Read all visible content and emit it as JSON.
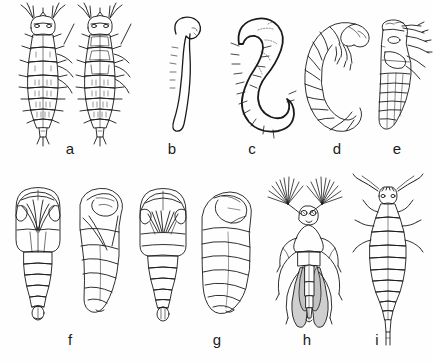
{
  "figure": {
    "type": "scientific-line-illustration",
    "panel_count": 9,
    "background_color": "#fefefe",
    "ink_color": "#1a1a1a",
    "shading_color": "#a8a8a8",
    "rows": 2,
    "row_1_panels": [
      "a",
      "b",
      "c",
      "d",
      "e"
    ],
    "row_2_panels": [
      "f",
      "g",
      "h",
      "i"
    ]
  },
  "labels": [
    {
      "id": "a",
      "text": "a",
      "x": 58,
      "y": 141,
      "caption": "first and second instar larvae, dorsal view"
    },
    {
      "id": "b",
      "text": "b",
      "x": 160,
      "y": 141,
      "caption": "prepupa, lateral outline"
    },
    {
      "id": "c",
      "text": "c",
      "x": 240,
      "y": 141,
      "caption": "curved setose larva, lateral view"
    },
    {
      "id": "d",
      "text": "d",
      "x": 325,
      "y": 141,
      "caption": "segmented larva with appendages, lateral view"
    },
    {
      "id": "e",
      "text": "e",
      "x": 385,
      "y": 141,
      "caption": "pupa with developing legs, lateral view"
    },
    {
      "id": "f",
      "text": "f",
      "x": 58,
      "y": 332,
      "caption": "pupa, ventral and lateral views"
    },
    {
      "id": "g",
      "text": "g",
      "x": 205,
      "y": 332,
      "caption": "pupa, ventral and lateral views"
    },
    {
      "id": "h",
      "text": "h",
      "x": 295,
      "y": 332,
      "caption": "adult with plumose antennae and shaded wings, dorsal view"
    },
    {
      "id": "i",
      "text": "i",
      "x": 365,
      "y": 332,
      "caption": "adult wingless form, dorsal view"
    }
  ],
  "panels": [
    {
      "id": "a",
      "name": "panel-a-larvae",
      "subjects": 2,
      "view": "dorsal",
      "features": [
        "antennae",
        "setae",
        "segmented abdomen",
        "terminal tube"
      ]
    },
    {
      "id": "b",
      "name": "panel-b-prepupa",
      "subjects": 1,
      "view": "lateral",
      "features": [
        "smooth outline",
        "recurved head",
        "marginal setae"
      ]
    },
    {
      "id": "c",
      "name": "panel-c-larva",
      "subjects": 1,
      "view": "lateral",
      "features": [
        "C-shaped body",
        "thick outline",
        "lateral setae"
      ]
    },
    {
      "id": "d",
      "name": "panel-d-larva",
      "subjects": 1,
      "view": "lateral",
      "features": [
        "transverse segmentation",
        "leg buds",
        "curved posture"
      ]
    },
    {
      "id": "e",
      "name": "panel-e-pupa",
      "subjects": 1,
      "view": "lateral",
      "features": [
        "free appendages",
        "wing pads",
        "abdominal segments"
      ]
    },
    {
      "id": "f",
      "name": "panel-f-pupa",
      "subjects": 2,
      "view": "ventral and lateral",
      "features": [
        "head capsule",
        "leg sheaths",
        "genital opening"
      ]
    },
    {
      "id": "g",
      "name": "panel-g-pupa",
      "subjects": 2,
      "view": "ventral and lateral",
      "features": [
        "mouthcone",
        "leg sheaths",
        "banded abdomen"
      ]
    },
    {
      "id": "h",
      "name": "panel-h-adult",
      "subjects": 1,
      "view": "dorsal",
      "features": [
        "plumose antennae",
        "compound eyes",
        "shaded wings",
        "six legs"
      ]
    },
    {
      "id": "i",
      "name": "panel-i-adult",
      "subjects": 1,
      "view": "dorsal",
      "features": [
        "clubbed antennae",
        "tapered abdomen",
        "terminal spine"
      ]
    }
  ]
}
